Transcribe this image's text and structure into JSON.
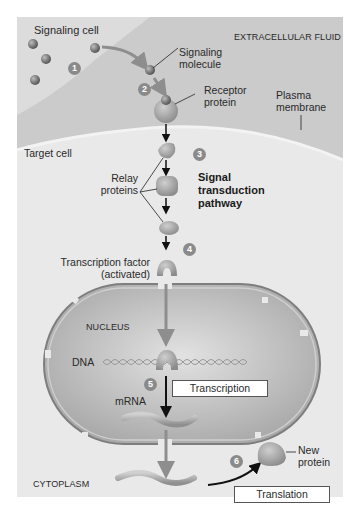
{
  "diagram": {
    "regions": {
      "extracellular": "EXTRACELLULAR FLUID",
      "target_cell": "Target cell",
      "nucleus": "NUCLEUS",
      "cytoplasm": "CYTOPLASM"
    },
    "labels": {
      "signaling_cell": "Signaling cell",
      "signaling_molecule_1": "Signaling",
      "signaling_molecule_2": "molecule",
      "receptor_1": "Receptor",
      "receptor_2": "protein",
      "plasma_1": "Plasma",
      "plasma_2": "membrane",
      "relay_1": "Relay",
      "relay_2": "proteins",
      "pathway_1": "Signal",
      "pathway_2": "transduction",
      "pathway_3": "pathway",
      "tf_1": "Transcription factor",
      "tf_2": "(activated)",
      "dna": "DNA",
      "mrna": "mRNA",
      "new_protein_1": "New",
      "new_protein_2": "protein"
    },
    "process_boxes": {
      "transcription": "Transcription",
      "translation": "Translation"
    },
    "steps": [
      "1",
      "2",
      "3",
      "4",
      "5",
      "6"
    ],
    "colors": {
      "extracellular_bg": "#c9c9c9",
      "cell_bg": "#e6e6e6",
      "nucleus_fill": "#bdbdbd",
      "molecule": "#7d7d7d",
      "arrow_gray": "#8e8e8e",
      "arrow_black": "#111111",
      "step_badge": "#8a8a8a"
    }
  }
}
